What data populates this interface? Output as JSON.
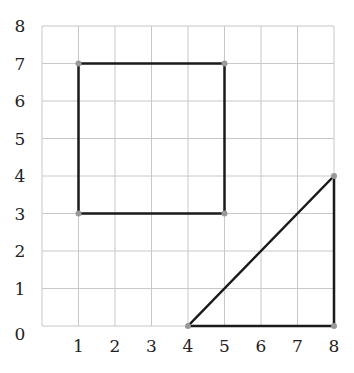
{
  "grid": {
    "x_range": [
      0,
      8
    ],
    "y_range": [
      0,
      8
    ],
    "x_ticks": [
      "1",
      "2",
      "3",
      "4",
      "5",
      "6",
      "7",
      "8"
    ],
    "y_ticks": [
      "0",
      "1",
      "2",
      "3",
      "4",
      "5",
      "6",
      "7",
      "8"
    ]
  },
  "shapes": [
    {
      "name": "square",
      "points": [
        [
          1,
          3
        ],
        [
          5,
          3
        ],
        [
          5,
          7
        ],
        [
          1,
          7
        ]
      ]
    },
    {
      "name": "right-triangle",
      "points": [
        [
          4,
          0
        ],
        [
          8,
          0
        ],
        [
          8,
          4
        ]
      ]
    }
  ],
  "colors": {
    "line": "#1a1a1a",
    "vertex": "#999999",
    "grid": "#c8c8c8"
  }
}
